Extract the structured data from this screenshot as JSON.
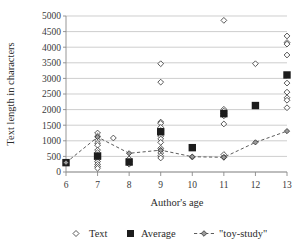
{
  "chart_data": {
    "type": "scatter",
    "title": "",
    "xlabel": "Author's age",
    "ylabel": "Text length in characters",
    "xlim": [
      6,
      13
    ],
    "ylim": [
      0,
      5000
    ],
    "grid": true,
    "legend_position": "bottom",
    "x_ticks": [
      "6",
      "7",
      "8",
      "9",
      "10",
      "11",
      "12",
      "13"
    ],
    "y_ticks": [
      "0",
      "500",
      "1000",
      "1500",
      "2000",
      "2500",
      "3000",
      "3500",
      "4000",
      "4500",
      "5000"
    ],
    "legend": [
      {
        "name": "Text",
        "marker": "open-diamond"
      },
      {
        "name": "Average",
        "marker": "filled-square"
      },
      {
        "name": "\"toy-study\"",
        "marker": "dashed-line-diamond"
      }
    ],
    "series": [
      {
        "name": "Text",
        "marker": "open-diamond",
        "points": [
          {
            "x": 7,
            "y": 1250
          },
          {
            "x": 7,
            "y": 1150
          },
          {
            "x": 7,
            "y": 1020
          },
          {
            "x": 7,
            "y": 930
          },
          {
            "x": 7,
            "y": 860
          },
          {
            "x": 7,
            "y": 700
          },
          {
            "x": 7,
            "y": 620
          },
          {
            "x": 7,
            "y": 540
          },
          {
            "x": 7,
            "y": 470
          },
          {
            "x": 7,
            "y": 400
          },
          {
            "x": 7,
            "y": 330
          },
          {
            "x": 7,
            "y": 250
          },
          {
            "x": 7,
            "y": 180
          },
          {
            "x": 7,
            "y": 120
          },
          {
            "x": 7.5,
            "y": 1090
          },
          {
            "x": 8,
            "y": 420
          },
          {
            "x": 8,
            "y": 330
          },
          {
            "x": 8,
            "y": 250
          },
          {
            "x": 9,
            "y": 3470
          },
          {
            "x": 9,
            "y": 2880
          },
          {
            "x": 9,
            "y": 1600
          },
          {
            "x": 9,
            "y": 1560
          },
          {
            "x": 9,
            "y": 1430
          },
          {
            "x": 9,
            "y": 1330
          },
          {
            "x": 9,
            "y": 1240
          },
          {
            "x": 9,
            "y": 1150
          },
          {
            "x": 9,
            "y": 1060
          },
          {
            "x": 9,
            "y": 950
          },
          {
            "x": 9,
            "y": 760
          },
          {
            "x": 9,
            "y": 690
          },
          {
            "x": 9,
            "y": 610
          },
          {
            "x": 9,
            "y": 520
          },
          {
            "x": 9,
            "y": 450
          },
          {
            "x": 10,
            "y": 480
          },
          {
            "x": 11,
            "y": 4860
          },
          {
            "x": 11,
            "y": 2010
          },
          {
            "x": 11,
            "y": 1950
          },
          {
            "x": 11,
            "y": 1870
          },
          {
            "x": 11,
            "y": 1800
          },
          {
            "x": 11,
            "y": 1540
          },
          {
            "x": 11,
            "y": 560
          },
          {
            "x": 11,
            "y": 470
          },
          {
            "x": 12,
            "y": 3470
          },
          {
            "x": 13,
            "y": 4360
          },
          {
            "x": 13,
            "y": 4150
          },
          {
            "x": 13,
            "y": 4100
          },
          {
            "x": 13,
            "y": 3750
          },
          {
            "x": 13,
            "y": 2850
          },
          {
            "x": 13,
            "y": 2560
          },
          {
            "x": 13,
            "y": 2380
          },
          {
            "x": 13,
            "y": 2300
          },
          {
            "x": 13,
            "y": 2060
          }
        ]
      },
      {
        "name": "Average",
        "marker": "filled-square",
        "points": [
          {
            "x": 6,
            "y": 300
          },
          {
            "x": 7,
            "y": 510
          },
          {
            "x": 8,
            "y": 320
          },
          {
            "x": 9,
            "y": 1290
          },
          {
            "x": 10,
            "y": 780
          },
          {
            "x": 11,
            "y": 1870
          },
          {
            "x": 12,
            "y": 2130
          },
          {
            "x": 13,
            "y": 3110
          }
        ]
      },
      {
        "name": "\"toy-study\"",
        "marker": "dashed-line-diamond",
        "points": [
          {
            "x": 6,
            "y": 300
          },
          {
            "x": 7,
            "y": 1120
          },
          {
            "x": 8,
            "y": 600
          },
          {
            "x": 9,
            "y": 700
          },
          {
            "x": 10,
            "y": 490
          },
          {
            "x": 11,
            "y": 470
          },
          {
            "x": 12,
            "y": 950
          },
          {
            "x": 13,
            "y": 1310
          }
        ]
      }
    ]
  }
}
